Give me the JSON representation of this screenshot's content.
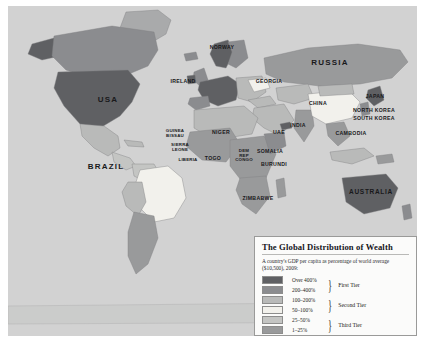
{
  "map": {
    "title": "world-choropleth",
    "ocean_color": "#d2d2d2",
    "labels": [
      {
        "name": "usa",
        "text": "USA",
        "x": 100,
        "y": 94,
        "size": "big"
      },
      {
        "name": "brazil",
        "text": "BRAZIL",
        "x": 98,
        "y": 161,
        "size": "big"
      },
      {
        "name": "russia",
        "text": "RUSSIA",
        "x": 322,
        "y": 57,
        "size": "big"
      },
      {
        "name": "australia",
        "text": "AUSTRALIA",
        "x": 363,
        "y": 186,
        "size": "mid"
      },
      {
        "name": "norway",
        "text": "NORWAY",
        "x": 214,
        "y": 42,
        "size": "small"
      },
      {
        "name": "ireland",
        "text": "IRELAND",
        "x": 175,
        "y": 76,
        "size": "small"
      },
      {
        "name": "georgia",
        "text": "GEORGIA",
        "x": 261,
        "y": 76,
        "size": "small"
      },
      {
        "name": "china",
        "text": "CHINA",
        "x": 310,
        "y": 98,
        "size": "small"
      },
      {
        "name": "japan",
        "text": "JAPAN",
        "x": 367,
        "y": 91,
        "size": "small"
      },
      {
        "name": "north-korea",
        "text": "NORTH KOREA",
        "x": 366,
        "y": 105,
        "size": "small"
      },
      {
        "name": "south-korea",
        "text": "SOUTH KOREA",
        "x": 366,
        "y": 113,
        "size": "small"
      },
      {
        "name": "cambodia",
        "text": "CAMBODIA",
        "x": 343,
        "y": 128,
        "size": "small"
      },
      {
        "name": "india",
        "text": "INDIA",
        "x": 290,
        "y": 120,
        "size": "small"
      },
      {
        "name": "uae",
        "text": "UAE",
        "x": 271,
        "y": 127,
        "size": "small"
      },
      {
        "name": "niger",
        "text": "NIGER",
        "x": 213,
        "y": 127,
        "size": "small"
      },
      {
        "name": "guinea-bissau",
        "text": "GUINEA\nBISSAU",
        "x": 167,
        "y": 128,
        "size": "tiny"
      },
      {
        "name": "sierra-leone",
        "text": "SIERRA\nLEONE",
        "x": 172,
        "y": 142,
        "size": "tiny"
      },
      {
        "name": "liberia",
        "text": "LIBERIA",
        "x": 180,
        "y": 154,
        "size": "tiny"
      },
      {
        "name": "togo",
        "text": "TOGO",
        "x": 205,
        "y": 153,
        "size": "small"
      },
      {
        "name": "dem-rep-congo",
        "text": "DEM\nREP\nCONGO",
        "x": 236,
        "y": 150,
        "size": "tiny"
      },
      {
        "name": "somalia",
        "text": "SOMALIA",
        "x": 262,
        "y": 146,
        "size": "small"
      },
      {
        "name": "burundi",
        "text": "BURUNDI",
        "x": 266,
        "y": 159,
        "size": "small"
      },
      {
        "name": "zimbabwe",
        "text": "ZIMBABWE",
        "x": 250,
        "y": 193,
        "size": "small"
      }
    ]
  },
  "legend": {
    "title": "The Global Distribution of Wealth",
    "subtitle": "A country's GDP per capita as percentage of world average ($10,500), 2009:",
    "entries": [
      {
        "name": "over-400",
        "range": "Over 400%",
        "color": "#5f6063"
      },
      {
        "name": "200-400",
        "range": "200–400%",
        "color": "#8b8c8f"
      },
      {
        "name": "100-200",
        "range": "100–200%",
        "color": "#b9bab9"
      },
      {
        "name": "50-100",
        "range": "50–100%",
        "color": "#f2f1ec"
      },
      {
        "name": "25-50",
        "range": "25–50%",
        "color": "#c4c5c3"
      },
      {
        "name": "1-25",
        "range": "1–25%",
        "color": "#999a9b"
      }
    ],
    "tiers": [
      {
        "name": "first-tier",
        "label": "First Tier",
        "brace": "}"
      },
      {
        "name": "second-tier",
        "label": "Second Tier",
        "brace": "}"
      },
      {
        "name": "third-tier",
        "label": "Third Tier",
        "brace": "}"
      }
    ]
  }
}
